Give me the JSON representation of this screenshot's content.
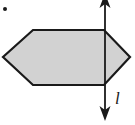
{
  "figure": {
    "kind": "geometry-diagram",
    "background_color": "#ffffff",
    "canvas": {
      "width": 135,
      "height": 125
    },
    "shape": {
      "name": "hexagon",
      "fill_color": "#d2d2d2",
      "stroke_color": "#1a1a1a",
      "stroke_width": 2.2,
      "vertices": [
        {
          "x": 33,
          "y": 30
        },
        {
          "x": 104,
          "y": 30
        },
        {
          "x": 130,
          "y": 57
        },
        {
          "x": 104,
          "y": 85
        },
        {
          "x": 33,
          "y": 85
        },
        {
          "x": 3,
          "y": 57
        }
      ]
    },
    "line": {
      "name": "line-l",
      "label": "l",
      "stroke_color": "#1a1a1a",
      "stroke_width": 1.8,
      "x": 105,
      "y_start": 0,
      "y_end": 118,
      "arrow_top": true,
      "arrow_bottom": true,
      "label_position": {
        "x": 115,
        "y": 90
      }
    },
    "marker_dot": {
      "name": "corner-dot",
      "x": 5,
      "y": 9,
      "radius": 2,
      "color": "#1a1a1a"
    }
  }
}
